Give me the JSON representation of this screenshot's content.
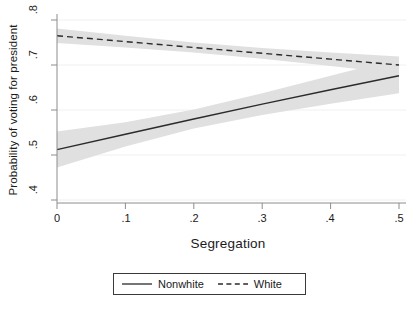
{
  "chart_data": {
    "type": "line",
    "title": "",
    "xlabel": "Segregation",
    "ylabel": "Probability of voting for president",
    "xlim": [
      0,
      0.5
    ],
    "ylim": [
      0.4,
      0.8
    ],
    "xticks": [
      "0",
      ".1",
      ".2",
      ".3",
      ".4",
      ".5"
    ],
    "xtick_values": [
      0,
      0.1,
      0.2,
      0.3,
      0.4,
      0.5
    ],
    "yticks": [
      ".4",
      ".5",
      ".6",
      ".7",
      ".8"
    ],
    "ytick_values": [
      0.4,
      0.5,
      0.6,
      0.7,
      0.8
    ],
    "grid": "horizontal-faint",
    "legend_position": "bottom-center",
    "band_color": "#e0e0e0",
    "line_color": "#2b2b2b",
    "x": [
      0,
      0.1,
      0.2,
      0.3,
      0.4,
      0.5
    ],
    "series": [
      {
        "name": "Nonwhite",
        "style": "solid",
        "values": [
          0.512,
          0.546,
          0.58,
          0.613,
          0.645,
          0.676
        ],
        "ci_lower": [
          0.472,
          0.519,
          0.559,
          0.589,
          0.614,
          0.637
        ],
        "ci_upper": [
          0.552,
          0.573,
          0.601,
          0.637,
          0.676,
          0.715
        ]
      },
      {
        "name": "White",
        "style": "dashed",
        "values": [
          0.765,
          0.752,
          0.739,
          0.726,
          0.713,
          0.7
        ],
        "ci_lower": [
          0.749,
          0.739,
          0.728,
          0.714,
          0.698,
          0.681
        ],
        "ci_upper": [
          0.781,
          0.765,
          0.75,
          0.738,
          0.728,
          0.719
        ]
      }
    ]
  },
  "axes": {
    "y_title": "Probability of voting for president",
    "x_title": "Segregation",
    "y_tick_labels": [
      ".8",
      ".7",
      ".6",
      ".5",
      ".4"
    ],
    "x_tick_labels": [
      "0",
      ".1",
      ".2",
      ".3",
      ".4",
      ".5"
    ]
  },
  "legend": {
    "items": [
      {
        "label": "Nonwhite",
        "style": "solid"
      },
      {
        "label": "White",
        "style": "dashed"
      }
    ]
  }
}
